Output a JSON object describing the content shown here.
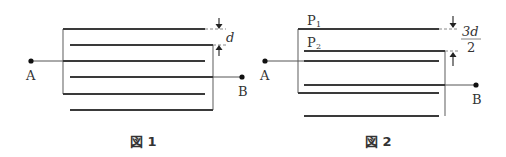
{
  "figures": [
    {
      "caption": "図 1",
      "terminal_a": "A",
      "terminal_b": "B",
      "spacing_label": "d",
      "plate_count": 6
    },
    {
      "caption": "図 2",
      "terminal_a": "A",
      "terminal_b": "B",
      "plate_1_label": "P",
      "plate_1_sub": "1",
      "plate_2_label": "P",
      "plate_2_sub": "2",
      "spacing_numerator": "3d",
      "spacing_denominator": "2",
      "plate_count": 6
    }
  ]
}
